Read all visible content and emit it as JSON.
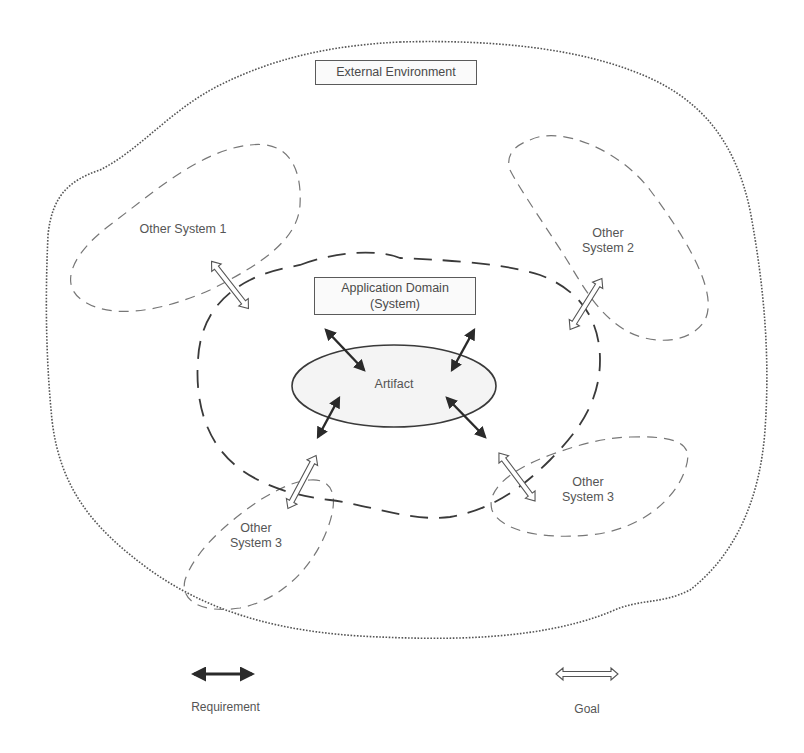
{
  "diagram": {
    "external_environment": {
      "label": "External Environment"
    },
    "application_domain": {
      "line1": "Application Domain",
      "line2": "(System)"
    },
    "artifact": {
      "label": "Artifact"
    },
    "other_systems": [
      {
        "line1": "Other System 1",
        "line2": ""
      },
      {
        "line1": "Other",
        "line2": "System 2"
      },
      {
        "line1": "Other",
        "line2": "System 3"
      },
      {
        "line1": "Other",
        "line2": "System 3"
      }
    ]
  },
  "legend": {
    "requirement": {
      "label": "Requirement",
      "icon": "solid-double-arrow"
    },
    "goal": {
      "label": "Goal",
      "icon": "hollow-double-arrow"
    }
  },
  "colors": {
    "line": "#4a4a4a",
    "dotted_boundary": "#555555",
    "dashed_other": "#777777",
    "artifact_fill": "#f4f4f4",
    "arrow_solid": "#2a2a2a"
  }
}
